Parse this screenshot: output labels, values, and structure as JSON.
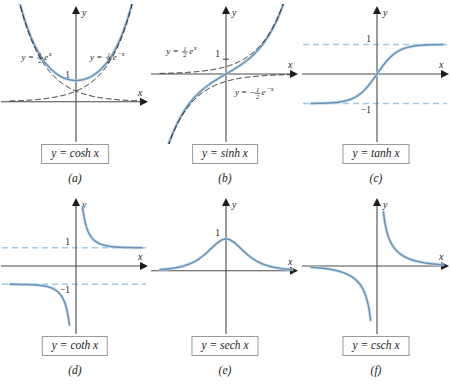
{
  "figure": {
    "title": "",
    "background": "#ffffff",
    "rows": 2,
    "cols": 3
  },
  "style": {
    "curve_color": "#6a91b4",
    "curve_halo": "#bcd7ea",
    "axis_color": "#4a4a4a",
    "dashed_curve_color": "#2b2b2b",
    "asymptote_color": "#9ec9e8",
    "box_border_color": "#9a9a9a",
    "text_color": "#1c1c1c"
  },
  "chart_data": [
    {
      "id": "cosh",
      "type": "line",
      "title": "y = cosh x",
      "caption": "(a)",
      "xlabel": "x",
      "ylabel": "y",
      "xlim": [
        -2.6,
        2.6
      ],
      "ylim": [
        -1.6,
        4.2
      ],
      "grid": false,
      "legend": "annotations",
      "yticks": [
        1
      ],
      "yticklabels": [
        "1"
      ],
      "series": [
        {
          "name": "y = cosh x",
          "fn": "cosh",
          "style": "solid",
          "color": "#6a91b4",
          "values_x": [
            -2.6,
            -2.0,
            -1.5,
            -1.0,
            -0.5,
            0,
            0.5,
            1.0,
            1.5,
            2.0,
            2.6
          ],
          "values_y": [
            6.769,
            3.762,
            2.352,
            1.543,
            1.128,
            1.0,
            1.128,
            1.543,
            2.352,
            3.762,
            6.769
          ]
        },
        {
          "name": "y = 1/2 e^x",
          "fn": "0.5*exp(x)",
          "style": "dashed",
          "color": "#2b2b2b",
          "values_x": [
            -2.6,
            -2.0,
            -1.0,
            0,
            1.0,
            2.0,
            2.6
          ],
          "values_y": [
            0.037,
            0.068,
            0.184,
            0.5,
            1.359,
            3.695,
            6.732
          ]
        },
        {
          "name": "y = 1/2 e^-x",
          "fn": "0.5*exp(-x)",
          "style": "dashed",
          "color": "#2b2b2b",
          "values_x": [
            -2.6,
            -2.0,
            -1.0,
            0,
            1.0,
            2.0,
            2.6
          ],
          "values_y": [
            6.732,
            3.695,
            1.359,
            0.5,
            0.184,
            0.068,
            0.037
          ]
        }
      ],
      "annotations": [
        {
          "name": "left-exponential-label",
          "text_parts": {
            "lead": "y = ",
            "num": "1",
            "den": "2",
            "base": "e",
            "exp": "x"
          },
          "x": -2.15,
          "y": 1.95
        },
        {
          "name": "right-exponential-label",
          "text_parts": {
            "lead": "y = ",
            "num": "1",
            "den": "2",
            "base": "e",
            "exp": "−x"
          },
          "x": 0.55,
          "y": 1.95
        }
      ]
    },
    {
      "id": "sinh",
      "type": "line",
      "title": "y = sinh x",
      "caption": "(b)",
      "xlabel": "x",
      "ylabel": "y",
      "xlim": [
        -2.6,
        2.6
      ],
      "ylim": [
        -4.2,
        4.2
      ],
      "grid": false,
      "legend": "annotations",
      "yticks": [
        1
      ],
      "yticklabels": [
        "1"
      ],
      "series": [
        {
          "name": "y = sinh x",
          "fn": "sinh",
          "style": "solid",
          "color": "#6a91b4",
          "values_x": [
            -2.6,
            -2.0,
            -1.5,
            -1.0,
            -0.5,
            0,
            0.5,
            1.0,
            1.5,
            2.0,
            2.6
          ],
          "values_y": [
            -6.695,
            -3.627,
            -2.129,
            -1.175,
            -0.521,
            0,
            0.521,
            1.175,
            2.129,
            3.627,
            6.695
          ]
        },
        {
          "name": "y = 1/2 e^x",
          "fn": "0.5*exp(x)",
          "style": "dashed",
          "color": "#2b2b2b",
          "values_x": [
            -2.6,
            -2.0,
            -1.0,
            0,
            1.0,
            2.0,
            2.6
          ],
          "values_y": [
            0.037,
            0.068,
            0.184,
            0.5,
            1.359,
            3.695,
            6.732
          ]
        },
        {
          "name": "y = -1/2 e^-x",
          "fn": "-0.5*exp(-x)",
          "style": "dashed",
          "color": "#2b2b2b",
          "values_x": [
            -2.6,
            -2.0,
            -1.0,
            0,
            1.0,
            2.0,
            2.6
          ],
          "values_y": [
            -6.732,
            -3.695,
            -1.359,
            -0.5,
            -0.184,
            -0.068,
            -0.037
          ]
        }
      ],
      "annotations": [
        {
          "name": "upper-exponential-label",
          "text_parts": {
            "lead": "y = ",
            "num": "1",
            "den": "2",
            "base": "e",
            "exp": "x"
          },
          "x": -2.35,
          "y": 1.35
        },
        {
          "name": "lower-exponential-label",
          "text_parts": {
            "lead": "y = −",
            "num": "1",
            "den": "2",
            "base": "e",
            "exp": "−x"
          },
          "x": 0.35,
          "y": -1.45
        }
      ]
    },
    {
      "id": "tanh",
      "type": "line",
      "title": "y = tanh x",
      "caption": "(c)",
      "xlabel": "x",
      "ylabel": "y",
      "xlim": [
        -3.2,
        3.2
      ],
      "ylim": [
        -2.1,
        2.1
      ],
      "grid": false,
      "legend": "none",
      "yticks": [
        1,
        -1
      ],
      "yticklabels": [
        "1",
        "−1"
      ],
      "series": [
        {
          "name": "y = tanh x",
          "fn": "tanh",
          "style": "solid",
          "color": "#6a91b4",
          "values_x": [
            -3.2,
            -2.0,
            -1.5,
            -1.0,
            -0.5,
            0,
            0.5,
            1.0,
            1.5,
            2.0,
            3.2
          ],
          "values_y": [
            -0.997,
            -0.964,
            -0.905,
            -0.762,
            -0.462,
            0,
            0.462,
            0.762,
            0.905,
            0.964,
            0.997
          ]
        }
      ],
      "asymptotes": [
        {
          "name": "upper-asymptote",
          "y": 1,
          "style": "dashed",
          "color": "#9ec9e8"
        },
        {
          "name": "lower-asymptote",
          "y": -1,
          "style": "dashed",
          "color": "#9ec9e8"
        }
      ],
      "annotations": []
    },
    {
      "id": "coth",
      "type": "line",
      "title": "y = coth x",
      "caption": "(d)",
      "xlabel": "x",
      "ylabel": "y",
      "xlim": [
        -3.2,
        3.2
      ],
      "ylim": [
        -3.4,
        3.4
      ],
      "grid": false,
      "legend": "none",
      "yticks": [
        1,
        -1
      ],
      "yticklabels": [
        "1",
        "−1"
      ],
      "series": [
        {
          "name": "y = coth x (x>0)",
          "fn": "coth",
          "style": "solid",
          "color": "#6a91b4",
          "values_x": [
            0.32,
            0.5,
            0.75,
            1.0,
            1.5,
            2.0,
            2.5,
            3.2
          ],
          "values_y": [
            3.17,
            2.163,
            1.568,
            1.313,
            1.105,
            1.037,
            1.014,
            1.003
          ]
        },
        {
          "name": "y = coth x (x<0)",
          "fn": "coth",
          "style": "solid",
          "color": "#6a91b4",
          "values_x": [
            -3.2,
            -2.5,
            -2.0,
            -1.5,
            -1.0,
            -0.75,
            -0.5,
            -0.32
          ],
          "values_y": [
            -1.003,
            -1.014,
            -1.037,
            -1.105,
            -1.313,
            -1.568,
            -2.163,
            -3.17
          ]
        }
      ],
      "asymptotes": [
        {
          "name": "upper-asymptote",
          "y": 1,
          "style": "dashed",
          "color": "#9ec9e8"
        },
        {
          "name": "lower-asymptote",
          "y": -1,
          "style": "dashed",
          "color": "#9ec9e8"
        }
      ],
      "annotations": []
    },
    {
      "id": "sech",
      "type": "line",
      "title": "y = sech x",
      "caption": "(e)",
      "xlabel": "x",
      "ylabel": "y",
      "xlim": [
        -4.0,
        4.0
      ],
      "ylim": [
        -1.8,
        2.1
      ],
      "grid": false,
      "legend": "none",
      "yticks": [
        1
      ],
      "yticklabels": [
        "1"
      ],
      "series": [
        {
          "name": "y = sech x",
          "fn": "sech",
          "style": "solid",
          "color": "#6a91b4",
          "values_x": [
            -4.0,
            -3.0,
            -2.0,
            -1.5,
            -1.0,
            -0.5,
            0,
            0.5,
            1.0,
            1.5,
            2.0,
            3.0,
            4.0
          ],
          "values_y": [
            0.037,
            0.099,
            0.266,
            0.425,
            0.648,
            0.887,
            1.0,
            0.887,
            0.648,
            0.425,
            0.266,
            0.099,
            0.037
          ]
        }
      ],
      "annotations": []
    },
    {
      "id": "csch",
      "type": "line",
      "title": "y = csch x",
      "caption": "(f)",
      "xlabel": "x",
      "ylabel": "y",
      "xlim": [
        -3.4,
        3.4
      ],
      "ylim": [
        -3.4,
        3.4
      ],
      "grid": false,
      "legend": "none",
      "yticks": [],
      "yticklabels": [],
      "series": [
        {
          "name": "y = csch x (x>0)",
          "fn": "csch",
          "style": "solid",
          "color": "#6a91b4",
          "values_x": [
            0.33,
            0.5,
            0.75,
            1.0,
            1.5,
            2.0,
            2.5,
            3.4
          ],
          "values_y": [
            3.01,
            1.919,
            1.212,
            0.851,
            0.469,
            0.276,
            0.165,
            0.067
          ]
        },
        {
          "name": "y = csch x (x<0)",
          "fn": "csch",
          "style": "solid",
          "color": "#6a91b4",
          "values_x": [
            -3.4,
            -2.5,
            -2.0,
            -1.5,
            -1.0,
            -0.75,
            -0.5,
            -0.33
          ],
          "values_y": [
            -0.067,
            -0.165,
            -0.276,
            -0.469,
            -0.851,
            -1.212,
            -1.919,
            -3.01
          ]
        }
      ],
      "annotations": []
    }
  ]
}
